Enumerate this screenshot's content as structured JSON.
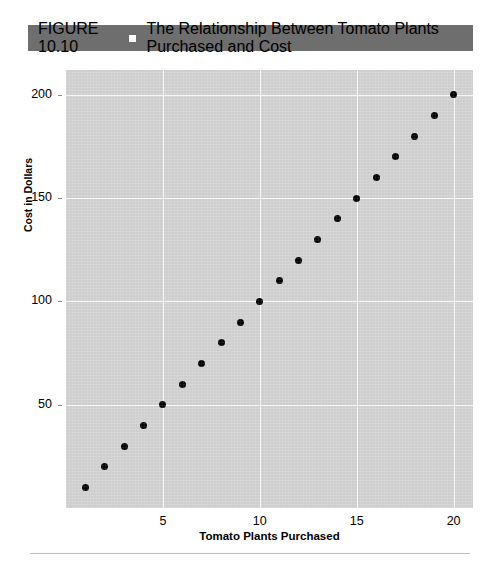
{
  "caption": {
    "figure_number": "FIGURE 10.10",
    "bullet_icon": "square-bullet-icon",
    "title": "The Relationship Between Tomato Plants Purchased and Cost"
  },
  "colors": {
    "caption_bar": "#6e6e6e",
    "caption_text": "#ffffff",
    "plot_background": "#d2d2d2",
    "gridline": "#fbfbfb",
    "point": "#000000",
    "footer_rule": "#bdbdbd"
  },
  "chart_data": {
    "type": "scatter",
    "title": "The Relationship Between Tomato Plants Purchased and Cost",
    "xlabel": "Tomato Plants Purchased",
    "ylabel": "Cost in Dollars",
    "xlim": [
      0,
      21
    ],
    "ylim": [
      0,
      212
    ],
    "xticks": [
      5,
      10,
      15,
      20
    ],
    "xticklabels": [
      "5",
      "10",
      "15",
      "20"
    ],
    "yticks": [
      50,
      100,
      150,
      200
    ],
    "yticklabels": [
      "50",
      "100",
      "150",
      "200"
    ],
    "grid": true,
    "legend": null,
    "relationship": "cost = 10 x plants",
    "x": [
      1,
      2,
      3,
      4,
      5,
      6,
      7,
      8,
      9,
      10,
      11,
      12,
      13,
      14,
      15,
      16,
      17,
      18,
      19,
      20
    ],
    "y": [
      10,
      20,
      30,
      40,
      50,
      60,
      70,
      80,
      90,
      100,
      110,
      120,
      130,
      140,
      150,
      160,
      170,
      180,
      190,
      200
    ],
    "points": [
      {
        "x": 1,
        "y": 10
      },
      {
        "x": 2,
        "y": 20
      },
      {
        "x": 3,
        "y": 30
      },
      {
        "x": 4,
        "y": 40
      },
      {
        "x": 5,
        "y": 50
      },
      {
        "x": 6,
        "y": 60
      },
      {
        "x": 7,
        "y": 70
      },
      {
        "x": 8,
        "y": 80
      },
      {
        "x": 9,
        "y": 90
      },
      {
        "x": 10,
        "y": 100
      },
      {
        "x": 11,
        "y": 110
      },
      {
        "x": 12,
        "y": 120
      },
      {
        "x": 13,
        "y": 130
      },
      {
        "x": 14,
        "y": 140
      },
      {
        "x": 15,
        "y": 150
      },
      {
        "x": 16,
        "y": 160
      },
      {
        "x": 17,
        "y": 170
      },
      {
        "x": 18,
        "y": 180
      },
      {
        "x": 19,
        "y": 190
      },
      {
        "x": 20,
        "y": 200
      }
    ]
  }
}
